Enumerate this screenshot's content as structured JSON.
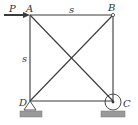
{
  "figure": {
    "type": "truss",
    "nodes": {
      "A": {
        "label": "A",
        "x": 30,
        "y": 15
      },
      "B": {
        "label": "B",
        "x": 113,
        "y": 15
      },
      "C": {
        "label": "C",
        "x": 113,
        "y": 101
      },
      "D": {
        "label": "D",
        "x": 30,
        "y": 101
      }
    },
    "members": [
      "AB",
      "BC",
      "CD",
      "DA",
      "AC",
      "BD"
    ],
    "dimensions": {
      "top": "s",
      "left": "s"
    },
    "load": {
      "label": "P",
      "at": "A",
      "direction": "right"
    },
    "supports": {
      "D": "pin",
      "C": "roller"
    },
    "colors": {
      "line": "#3a3a3a",
      "ground": "#9a9a9a"
    }
  }
}
